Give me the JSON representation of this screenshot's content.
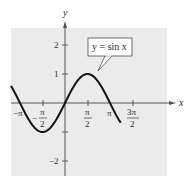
{
  "chart_data": {
    "type": "line",
    "title": "",
    "xlabel": "x",
    "ylabel": "y",
    "series": [
      {
        "name": "y = sin x",
        "function": "sin(x)",
        "x_range": [
          -3.77,
          3.89
        ]
      }
    ],
    "x_ticks": [
      "-π",
      "-π/2",
      "π/2",
      "π",
      "3π/2"
    ],
    "x_tick_values": [
      -3.1416,
      -1.5708,
      1.5708,
      3.1416,
      4.7124
    ],
    "y_ticks": [
      "2",
      "1",
      "-1",
      "-2"
    ],
    "y_tick_values": [
      2,
      1,
      -1,
      -2
    ],
    "xlim": [
      -3.77,
      3.89
    ],
    "ylim": [
      -2.5,
      2.6
    ],
    "grid": false,
    "legend": null,
    "annotations": [
      {
        "text": "y = sin x",
        "points_to": [
          1.2,
          0.93
        ]
      }
    ],
    "background": "#ebebeb",
    "line_color": "#111111"
  },
  "labels": {
    "x_axis": "x",
    "y_axis": "y",
    "callout": "y = sin x",
    "y_tick_2": "2",
    "y_tick_1": "1",
    "y_tick_m2": "−2",
    "x_tick_mpi": "−π",
    "x_tick_mpi2_minus": "−",
    "x_tick_pi_num": "π",
    "x_tick_two": "2",
    "x_tick_pi": "π",
    "x_tick_3pi_num": "3π"
  }
}
